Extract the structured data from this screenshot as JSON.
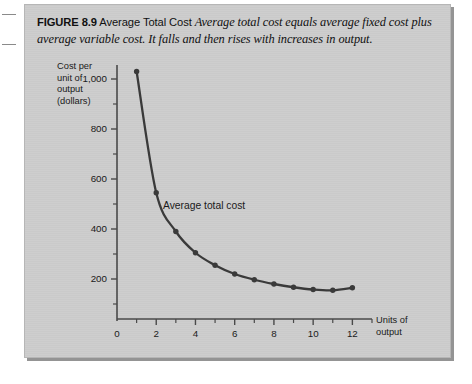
{
  "figure": {
    "number_label": "FIGURE 8.9",
    "title": "Average Total Cost",
    "description": "Average total cost equals average fixed cost plus average variable cost. It falls and then rises with increases in output."
  },
  "colors": {
    "panel_background": "#cdcdcd",
    "curve": "#3a3a3a",
    "axis": "#4a4a4a",
    "text": "#1a1a1a"
  },
  "chart_data": {
    "type": "line",
    "title": "Average Total Cost",
    "xlabel": "Units of output",
    "ylabel": "Cost per unit of output (dollars)",
    "ylabel_lines": [
      "Cost per",
      "unit of",
      "output",
      "(dollars)"
    ],
    "xlabel_lines": [
      "Units of",
      "output"
    ],
    "xlim": [
      0,
      13
    ],
    "ylim": [
      0,
      1100
    ],
    "xticks": [
      0,
      2,
      4,
      6,
      8,
      10,
      12
    ],
    "xtick_labels": [
      "0",
      "2",
      "4",
      "6",
      "8",
      "10",
      "12"
    ],
    "x_minor_ticks": [
      1,
      3,
      5,
      7,
      9,
      11,
      13
    ],
    "yticks": [
      200,
      400,
      600,
      800,
      1000
    ],
    "ytick_labels": [
      "200",
      "400",
      "600",
      "800",
      "1,000"
    ],
    "y_minor_ticks": [
      100,
      300,
      500,
      700,
      900,
      1100
    ],
    "grid": false,
    "legend": "none",
    "series": [
      {
        "name": "Average total cost",
        "annotation": "Average total cost",
        "marker": "circle",
        "x": [
          1,
          2,
          3,
          4,
          5,
          6,
          7,
          8,
          9,
          10,
          11,
          12
        ],
        "values": [
          1030,
          545,
          390,
          305,
          255,
          220,
          197,
          180,
          167,
          158,
          155,
          165
        ]
      }
    ]
  }
}
